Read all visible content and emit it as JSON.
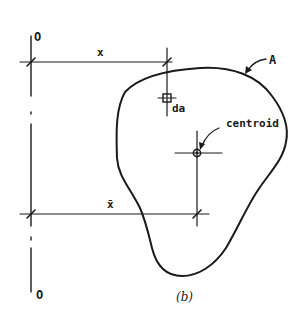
{
  "figure": {
    "caption": "(b)",
    "colors": {
      "ink": "#1a1a1a",
      "background": "#ffffff"
    },
    "axis": {
      "label_top": "O",
      "label_bottom": "O"
    },
    "dimensions": {
      "x": {
        "label": "x"
      },
      "x_bar": {
        "label": "x̄"
      }
    },
    "labels": {
      "area": "A",
      "element": "da",
      "centroid": "centroid"
    }
  }
}
